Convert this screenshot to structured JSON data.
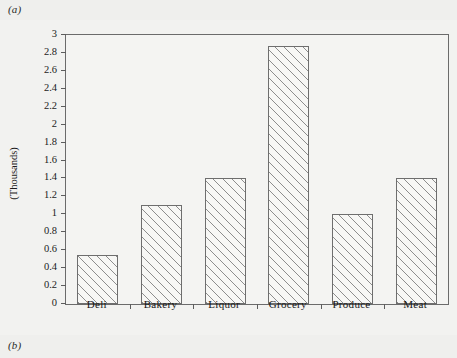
{
  "figure": {
    "label_a": "(a)",
    "label_b": "(b)"
  },
  "chart_data": {
    "type": "bar",
    "title": "",
    "xlabel": "",
    "ylabel": "(Thousands)",
    "categories": [
      "Deli",
      "Bakery",
      "Liquor",
      "Grocery",
      "Produce",
      "Meat"
    ],
    "values": [
      0.55,
      1.1,
      1.4,
      2.88,
      1.0,
      1.4
    ],
    "ylim": [
      0,
      3
    ],
    "ytick_step": 0.2,
    "yticks": [
      "3",
      "2.8",
      "2.6",
      "2.4",
      "2.2",
      "2",
      "1.8",
      "1.6",
      "1.4",
      "1.2",
      "1",
      "0.8",
      "0.6",
      "0.4",
      "0.2",
      "0"
    ],
    "grid": false,
    "legend": "none",
    "bar_fill": "diagonal-hatch",
    "colors": {
      "background": "#efefed",
      "plot_background": "#f4f4f2",
      "axis": "#6b6b6b",
      "hatch": "#8d8d8d",
      "text": "#1b1b1b"
    }
  }
}
